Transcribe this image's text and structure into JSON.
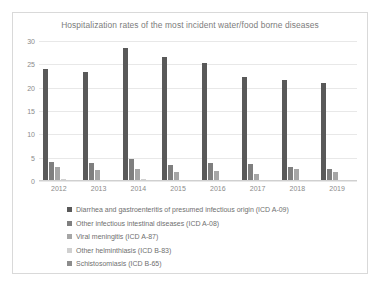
{
  "chart_data": {
    "type": "bar",
    "title": "Hospitalization rates of the most incident water/food borne diseases",
    "xlabel": "",
    "ylabel": "",
    "categories": [
      "2012",
      "2013",
      "2014",
      "2015",
      "2016",
      "2017",
      "2018",
      "2019"
    ],
    "ylim": [
      0,
      30
    ],
    "yticks": [
      0,
      5,
      10,
      15,
      20,
      25,
      30
    ],
    "grid": true,
    "legend_position": "bottom-left",
    "series": [
      {
        "name": "Diarrhea and gastroenteritis of presumed infectious origin (ICD A-09)",
        "color": "#595959",
        "values": [
          24,
          23.3,
          28.5,
          26.5,
          25.3,
          22.3,
          21.7,
          21
        ]
      },
      {
        "name": "Other infectious intestinal diseases (ICD A-08)",
        "color": "#7f7f7f",
        "values": [
          4.0,
          3.8,
          4.8,
          3.4,
          3.9,
          3.7,
          2.9,
          2.6
        ]
      },
      {
        "name": "Viral meningitis (ICD A-87)",
        "color": "#a6a6a6",
        "values": [
          3.0,
          2.3,
          2.6,
          2.0,
          2.1,
          1.6,
          2.6,
          1.9
        ]
      },
      {
        "name": "Other helminthiasis (ICD B-83)",
        "color": "#d0d0d0",
        "values": [
          0.4,
          0.3,
          0.4,
          0.3,
          0.3,
          0.3,
          0.3,
          0.3
        ]
      },
      {
        "name": "Schistosomiasis (ICD B-65)",
        "color": "#8c8c8c",
        "values": [
          0.2,
          0.2,
          0.2,
          0.2,
          0.2,
          0.2,
          0.2,
          0.2
        ]
      }
    ]
  }
}
